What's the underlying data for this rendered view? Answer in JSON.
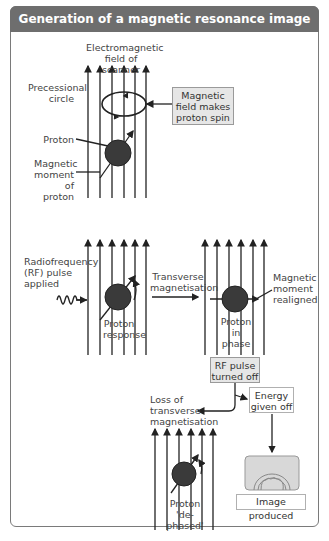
{
  "title": "Generation of a magnetic resonance image",
  "colors": {
    "header_bg": "#6e6e6e",
    "header_text": "#ffffff",
    "proton": "#3a3a3a",
    "box_bg": "#e6e6e6",
    "lines": "#222222"
  },
  "labels": {
    "field": "Electromagnetic field of scanner",
    "precessional": "Precessional circle",
    "field_box": "Magnetic field makes proton spin",
    "proton": "Proton",
    "moment": "Magnetic moment of proton",
    "rf_applied": "Radiofrequency (RF) pulse applied",
    "transverse": "Transverse magnetisation",
    "response": "Proton response",
    "in_phase": "Proton in phase",
    "realigned": "Magnetic moment realigned",
    "rf_off": "RF pulse turned off",
    "energy": "Energy given off",
    "loss": "Loss of transverse magnetisation",
    "dephased": "Proton 'de-phased'",
    "image_produced": "Image produced"
  }
}
